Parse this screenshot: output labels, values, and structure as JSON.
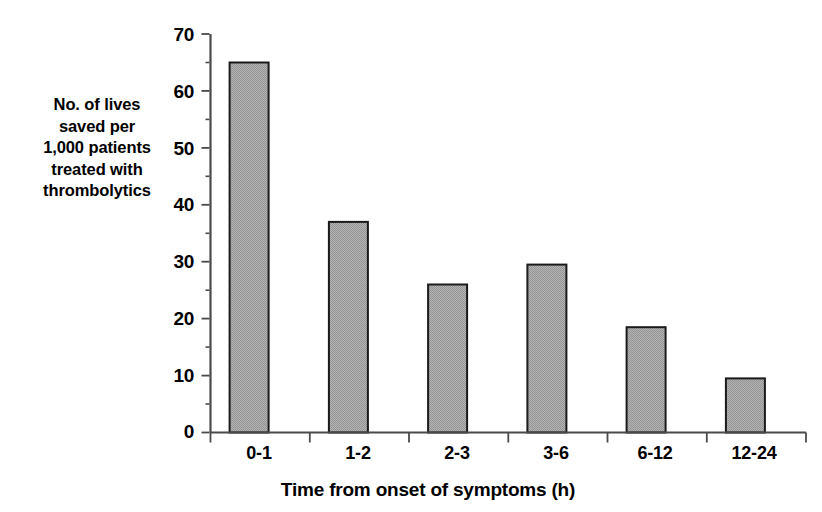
{
  "chart_data": {
    "type": "bar",
    "title": "",
    "subtitle": "",
    "categories": [
      "0-1",
      "1-2",
      "2-3",
      "3-6",
      "6-12",
      "12-24"
    ],
    "values": [
      65,
      37,
      26,
      29.5,
      18.5,
      9.5
    ],
    "series": [
      {
        "name": "Lives saved per 1,000 patients",
        "values": [
          65,
          37,
          26,
          29.5,
          18.5,
          9.5
        ]
      }
    ],
    "xlabel": "Time from onset of symptoms (h)",
    "ylabel": "No. of lives saved per 1,000 patients treated with thrombolytics",
    "ylabel_lines": [
      "No. of lives",
      "saved per",
      "1,000 patients",
      "treated with",
      "thrombolytics"
    ],
    "ylim": [
      0,
      70
    ],
    "ytick_labels": [
      "70",
      "60",
      "50",
      "40",
      "30",
      "20",
      "10",
      "0"
    ],
    "ytick_values": [
      70,
      60,
      50,
      40,
      30,
      20,
      10,
      0
    ],
    "ytick_step": 10,
    "grid": false,
    "legend": false,
    "legend_position": "none",
    "bar_fill_color": "#a9a9a9",
    "bar_edge_color": "#1a1a1a",
    "axis_color": "#404040",
    "background_color": "#ffffff"
  }
}
